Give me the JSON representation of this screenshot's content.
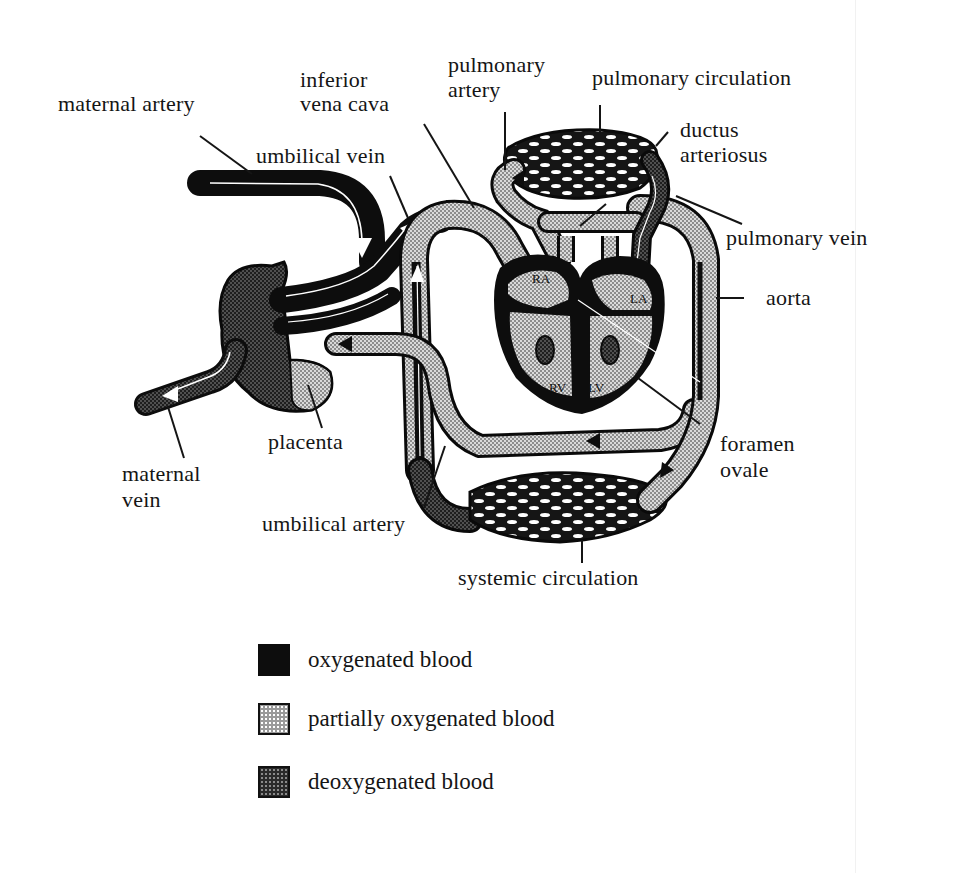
{
  "diagram": {
    "labels": {
      "maternal_artery": "maternal artery",
      "inferior_vena_cava_line1": "inferior",
      "inferior_vena_cava_line2": "vena cava",
      "pulmonary_artery_line1": "pulmonary",
      "pulmonary_artery_line2": "artery",
      "pulmonary_circulation": "pulmonary circulation",
      "ductus_arteriosus_line1": "ductus",
      "ductus_arteriosus_line2": "arteriosus",
      "umbilical_vein": "umbilical vein",
      "pulmonary_vein": "pulmonary vein",
      "aorta": "aorta",
      "placenta": "placenta",
      "foramen_ovale_line1": "foramen",
      "foramen_ovale_line2": "ovale",
      "maternal_vein_line1": "maternal",
      "maternal_vein_line2": "vein",
      "umbilical_artery": "umbilical artery",
      "systemic_circulation": "systemic circulation"
    },
    "heart_chambers": {
      "ra": "RA",
      "la": "LA",
      "rv": "RV",
      "lv": "LV"
    }
  },
  "legend": {
    "items": [
      {
        "key": "oxygenated",
        "label": "oxygenated blood",
        "fill": "#0d0d0d"
      },
      {
        "key": "partial",
        "label": "partially oxygenated blood",
        "fill": "#9a9a9a"
      },
      {
        "key": "deoxygenated",
        "label": "deoxygenated blood",
        "fill": "#2a2a2a"
      }
    ]
  }
}
